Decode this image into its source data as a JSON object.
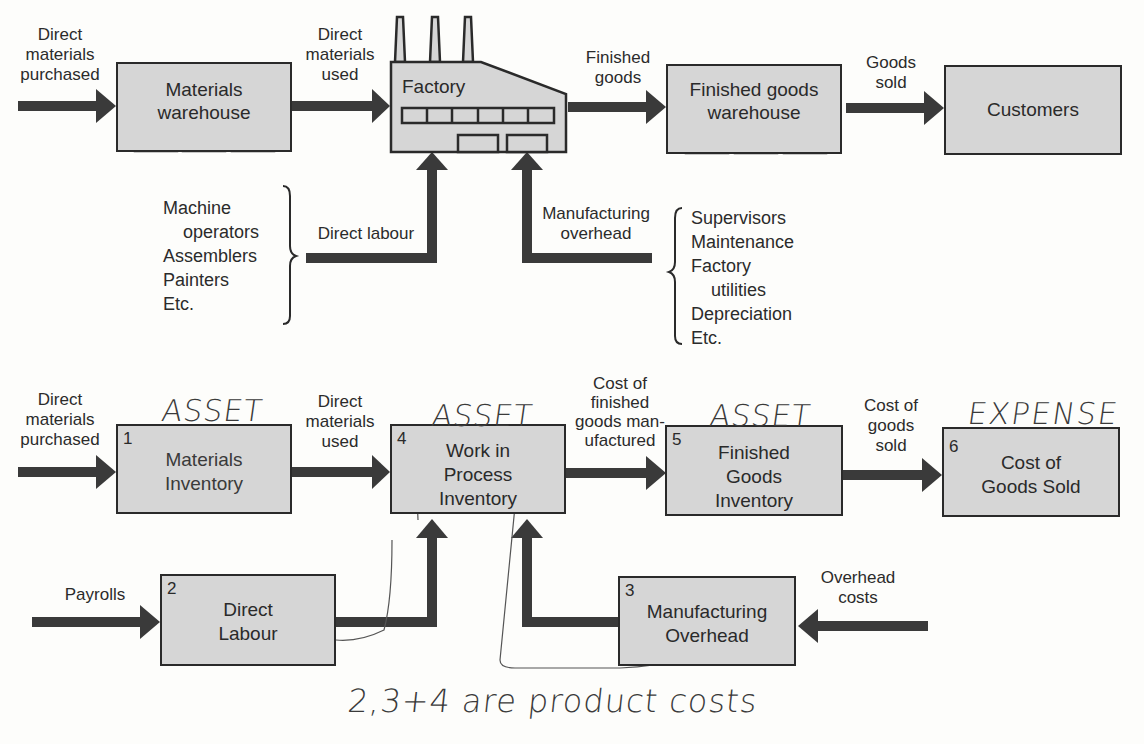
{
  "physical_flow": {
    "arrows": {
      "dm_purchased": "Direct materials purchased",
      "dm_used": "Direct materials used",
      "finished_goods": "Finished goods",
      "goods_sold": "Goods sold",
      "direct_labour": "Direct labour",
      "manufacturing_overhead": "Manufacturing overhead"
    },
    "arrow_lines": {
      "dm_purchased": [
        "Direct",
        "materials",
        "purchased"
      ],
      "dm_used": [
        "Direct",
        "materials",
        "used"
      ],
      "finished_goods": [
        "Finished",
        "goods"
      ],
      "goods_sold": [
        "Goods",
        "sold"
      ],
      "manufacturing_overhead": [
        "Manufacturing",
        "overhead"
      ]
    },
    "nodes": {
      "materials_warehouse": [
        "Materials",
        "warehouse"
      ],
      "factory": "Factory",
      "finished_goods_warehouse": [
        "Finished goods",
        "warehouse"
      ],
      "customers": "Customers"
    },
    "labour_list": [
      "Machine",
      "operators",
      "Assemblers",
      "Painters",
      "Etc."
    ],
    "overhead_list": [
      "Supervisors",
      "Maintenance",
      "Factory",
      "utilities",
      "Depreciation",
      "Etc."
    ]
  },
  "cost_flow": {
    "arrows": {
      "dm_purchased": [
        "Direct",
        "materials",
        "purchased"
      ],
      "dm_used": [
        "Direct",
        "materials",
        "used"
      ],
      "cost_fg_manufactured": [
        "Cost of",
        "finished",
        "goods man-",
        "ufactured"
      ],
      "cogs": [
        "Cost of",
        "goods",
        "sold"
      ],
      "payrolls": "Payrolls",
      "overhead_costs": [
        "Overhead",
        "costs"
      ]
    },
    "nodes": [
      {
        "num": "1",
        "lines": [
          "Materials",
          "Inventory"
        ],
        "annotation": "ASSET"
      },
      {
        "num": "2",
        "lines": [
          "Direct",
          "Labour"
        ]
      },
      {
        "num": "3",
        "lines": [
          "Manufacturing",
          "Overhead"
        ]
      },
      {
        "num": "4",
        "lines": [
          "Work in",
          "Process",
          "Inventory"
        ],
        "annotation": "ASSET"
      },
      {
        "num": "5",
        "lines": [
          "Finished",
          "Goods",
          "Inventory"
        ],
        "annotation": "ASSET"
      },
      {
        "num": "6",
        "lines": [
          "Cost of",
          "Goods Sold"
        ],
        "annotation": "EXPENSE"
      }
    ],
    "handwritten_note": "2,3+4 are product costs"
  },
  "colors": {
    "box_fill": "#d6d6d6",
    "arrow": "#3a3a3a",
    "outline": "#2a2a2a"
  }
}
